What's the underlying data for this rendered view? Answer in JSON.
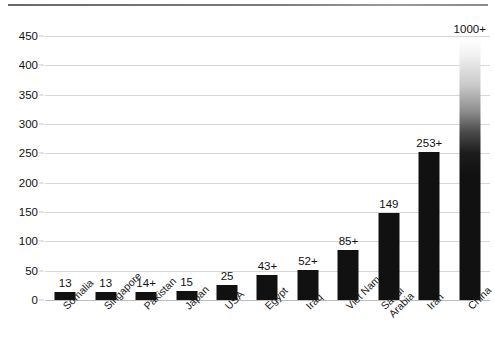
{
  "chart_data": {
    "type": "bar",
    "title": "",
    "subtitle": "",
    "xlabel": "",
    "ylabel": "",
    "ylim": [
      0,
      450
    ],
    "ytick_step": 50,
    "grid": true,
    "legend": "none",
    "orientation": "vertical",
    "bar_color": "#111111",
    "gridline_color": "#d7d7d7",
    "categories": [
      "Somalia",
      "Singapore",
      "Pakistan",
      "Japan",
      "USA",
      "Egypt",
      "Iraq",
      "Viet Nam",
      "Saudi Arabia",
      "Iran",
      "China"
    ],
    "category_lines": [
      [
        "Somalia"
      ],
      [
        "Singapore"
      ],
      [
        "Pakistan"
      ],
      [
        "Japan"
      ],
      [
        "USA"
      ],
      [
        "Egypt"
      ],
      [
        "Iraq"
      ],
      [
        "Viet Nam"
      ],
      [
        "Saudi",
        "Arabia"
      ],
      [
        "Iran"
      ],
      [
        "China"
      ]
    ],
    "values": [
      13,
      13,
      14,
      15,
      25,
      43,
      52,
      85,
      149,
      253,
      1000
    ],
    "data_labels": [
      "13",
      "13",
      "14+",
      "15",
      "25",
      "43+",
      "52+",
      "85+",
      "149",
      "253+",
      "1000+"
    ],
    "truncated_bars": [
      "China"
    ],
    "yticks": [
      "450",
      "400",
      "350",
      "300",
      "250",
      "200",
      "150",
      "100",
      "50",
      "0"
    ],
    "ytick_values": [
      450,
      400,
      350,
      300,
      250,
      200,
      150,
      100,
      50,
      0
    ],
    "annotations": [
      "China bar exceeds axis maximum and is drawn with a fade-to-white top indicating a clipped value"
    ]
  }
}
